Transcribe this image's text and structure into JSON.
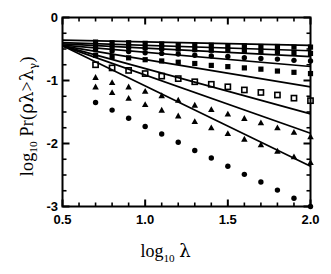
{
  "chart_data": {
    "type": "line",
    "title": "",
    "xlabel": "log10 λ",
    "ylabel": "log10 Pr(ρλ>λγ)",
    "xlim": [
      0.5,
      2.0
    ],
    "ylim": [
      -3,
      0
    ],
    "grid": false,
    "legend": "none",
    "x_ticks": [
      0.5,
      1.0,
      1.5,
      2.0
    ],
    "x_tick_labels": [
      "0.5",
      "1.0",
      "1.5",
      "2.0"
    ],
    "x_minor_step": 0.1,
    "y_ticks": [
      0,
      -1,
      -2,
      -3
    ],
    "y_tick_labels": [
      "0",
      "-1",
      "-2",
      "-3"
    ],
    "y_minor_step": 0.25,
    "x": [
      0.7,
      0.8,
      0.9,
      1.0,
      1.1,
      1.2,
      1.3,
      1.4,
      1.5,
      1.6,
      1.7,
      1.8,
      1.9,
      2.0
    ],
    "series": [
      {
        "name": "series-1",
        "marker": "filled-square",
        "intercept": -0.36,
        "slope": -0.055,
        "values": [
          -0.39,
          -0.4,
          -0.4,
          -0.41,
          -0.42,
          -0.43,
          -0.43,
          -0.44,
          -0.45,
          -0.45,
          -0.46,
          -0.46,
          -0.47,
          -0.47
        ]
      },
      {
        "name": "series-2",
        "marker": "filled-square",
        "intercept": -0.4,
        "slope": -0.085,
        "values": [
          -0.45,
          -0.46,
          -0.47,
          -0.48,
          -0.49,
          -0.5,
          -0.51,
          -0.52,
          -0.52,
          -0.53,
          -0.54,
          -0.55,
          -0.56,
          -0.57
        ]
      },
      {
        "name": "series-3",
        "marker": "filled-circle",
        "intercept": -0.42,
        "slope": -0.135,
        "values": [
          -0.51,
          -0.53,
          -0.54,
          -0.56,
          -0.57,
          -0.58,
          -0.6,
          -0.61,
          -0.62,
          -0.64,
          -0.65,
          -0.66,
          -0.68,
          -0.69
        ]
      },
      {
        "name": "series-4",
        "marker": "filled-square",
        "intercept": -0.44,
        "slope": -0.225,
        "values": [
          -0.6,
          -0.62,
          -0.64,
          -0.67,
          -0.69,
          -0.71,
          -0.73,
          -0.76,
          -0.78,
          -0.8,
          -0.82,
          -0.85,
          -0.87,
          -0.89
        ]
      },
      {
        "name": "series-5",
        "marker": "open-square",
        "intercept": -0.45,
        "slope": -0.435,
        "values": [
          -0.75,
          -0.8,
          -0.84,
          -0.89,
          -0.93,
          -0.97,
          -1.02,
          -1.06,
          -1.1,
          -1.15,
          -1.19,
          -1.23,
          -1.28,
          -1.32
        ]
      },
      {
        "name": "series-6",
        "marker": "filled-triangle",
        "intercept": -0.45,
        "slope": -0.72,
        "values": [
          -0.95,
          -1.03,
          -1.1,
          -1.17,
          -1.24,
          -1.31,
          -1.39,
          -1.46,
          -1.53,
          -1.6,
          -1.67,
          -1.75,
          -1.82,
          -1.89
        ]
      },
      {
        "name": "series-7",
        "marker": "filled-triangle",
        "intercept": -0.45,
        "slope": -0.925,
        "values": [
          -1.1,
          -1.19,
          -1.28,
          -1.38,
          -1.47,
          -1.56,
          -1.65,
          -1.75,
          -1.84,
          -1.93,
          -2.02,
          -2.12,
          -2.21,
          -2.3
        ]
      },
      {
        "name": "series-8",
        "marker": "filled-circle",
        "intercept": -0.45,
        "slope": -1.275,
        "values": [
          -1.35,
          -1.47,
          -1.6,
          -1.73,
          -1.85,
          -1.98,
          -2.11,
          -2.23,
          -2.36,
          -2.49,
          -2.61,
          -2.74,
          -2.87,
          -3.0
        ]
      }
    ]
  },
  "axes": {
    "x_label_parts": {
      "log": "log",
      "base": "10",
      "var": "λ"
    },
    "y_label_parts": {
      "log": "log",
      "base": "10",
      "pr": "Pr(",
      "rho": "ρ",
      "lam1": "λ",
      "gt": ">",
      "lam2": "λ",
      "gamma": "γ",
      "close": ")"
    }
  },
  "style": {
    "line_color": "#000000",
    "marker_color": "#000000",
    "frame_color": "#000000",
    "background": "#ffffff"
  }
}
